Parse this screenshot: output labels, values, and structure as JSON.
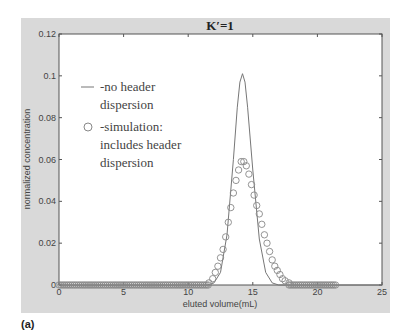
{
  "chart_data": {
    "type": "line",
    "title": "K′=1",
    "xlabel": "eluted volume(mL)",
    "ylabel": "normalized concentration",
    "xlim": [
      0,
      25
    ],
    "ylim": [
      0,
      0.12
    ],
    "xticks": [
      0,
      5,
      10,
      15,
      20,
      25
    ],
    "xtick_labels": [
      "0",
      "5",
      "10",
      "15",
      "20",
      "25"
    ],
    "yticks": [
      0,
      0.02,
      0.04,
      0.06,
      0.08,
      0.1,
      0.12
    ],
    "ytick_labels": [
      "0",
      "0.02",
      "0.04",
      "0.06",
      "0.08",
      "0.1",
      "0.12"
    ],
    "grid": false,
    "legend_position": "upper-left (inside)",
    "series": [
      {
        "name": "-no header dispersion",
        "style": "solid line",
        "x": [
          0,
          11.5,
          12.0,
          12.5,
          13.0,
          13.5,
          13.8,
          14.0,
          14.2,
          14.4,
          14.6,
          15.0,
          15.5,
          16.0,
          16.5,
          17.0,
          17.5,
          25
        ],
        "y": [
          0,
          0.0,
          0.001,
          0.006,
          0.024,
          0.06,
          0.085,
          0.097,
          0.101,
          0.097,
          0.085,
          0.055,
          0.022,
          0.006,
          0.001,
          0.0,
          0.0,
          0.0
        ]
      },
      {
        "name": "-simulation: includes header dispersion",
        "style": "open circles",
        "x": [
          0,
          2,
          4,
          6,
          8,
          10,
          11,
          11.6,
          11.9,
          12.1,
          12.3,
          12.5,
          12.7,
          12.9,
          13.1,
          13.3,
          13.5,
          13.7,
          13.9,
          14.1,
          14.3,
          14.5,
          14.7,
          14.9,
          15.1,
          15.3,
          15.5,
          15.7,
          15.9,
          16.1,
          16.3,
          16.5,
          16.7,
          16.9,
          17.1,
          17.3,
          17.5,
          17.8,
          18.2,
          19,
          20,
          21,
          21.5
        ],
        "y": [
          0,
          0,
          0,
          0,
          0,
          0,
          0,
          0.001,
          0.003,
          0.006,
          0.009,
          0.013,
          0.017,
          0.023,
          0.03,
          0.037,
          0.044,
          0.05,
          0.055,
          0.059,
          0.059,
          0.057,
          0.053,
          0.048,
          0.043,
          0.038,
          0.034,
          0.029,
          0.024,
          0.02,
          0.016,
          0.012,
          0.009,
          0.007,
          0.005,
          0.003,
          0.002,
          0.001,
          0,
          0,
          0,
          0,
          0
        ]
      }
    ]
  },
  "legend": {
    "line_label_1": "-no header",
    "line_label_2": "dispersion",
    "circle_label_1": "-simulation:",
    "circle_label_2": "includes header",
    "circle_label_3": "dispersion"
  },
  "panel_label": "(a)",
  "colors": {
    "figure_bg": "#d9d9d9",
    "axes_bg": "#ffffff",
    "axis": "#555555",
    "line": "#777777",
    "marker": "#888888",
    "text": "#333333"
  }
}
